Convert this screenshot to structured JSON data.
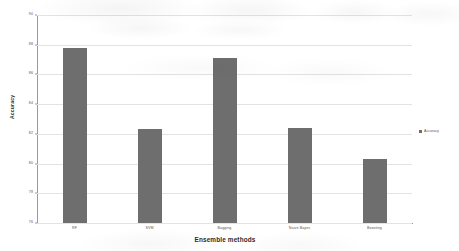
{
  "chart_data": {
    "type": "bar",
    "title": "",
    "categories": [
      "RF",
      "SVM",
      "Bagging",
      "Naive Bayes",
      "Boosting"
    ],
    "values": [
      87.8,
      82.3,
      87.1,
      82.4,
      80.3
    ],
    "series": [
      {
        "name": "Accuracy",
        "values": [
          87.8,
          82.3,
          87.1,
          82.4,
          80.3
        ]
      }
    ],
    "xlabel": "Ensemble methods",
    "ylabel": "Accuracy",
    "ylim": [
      76,
      90
    ],
    "ytick_labels": [
      "90",
      "88",
      "86",
      "84",
      "82",
      "80",
      "78",
      "76"
    ],
    "ytick_values": [
      90,
      88,
      86,
      84,
      82,
      80,
      78,
      76
    ],
    "grid": true,
    "legend_position": "right",
    "legend_entries": [
      "Accuracy"
    ],
    "bar_color": "#6e6e6e",
    "gridline_color": "#e3e3e3",
    "axis_color": "#9a9a9a"
  }
}
